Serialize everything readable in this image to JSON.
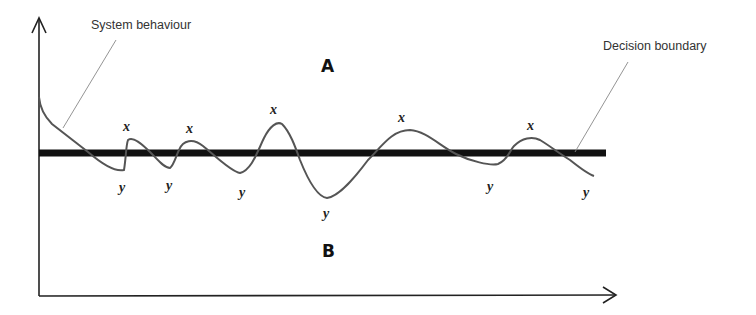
{
  "diagram": {
    "type": "decision-boundary-illustration",
    "colors": {
      "axis": "#222222",
      "boundary": "#111111",
      "curve": "#555555",
      "leader": "#888888",
      "text": "#333333"
    },
    "callouts": {
      "system_behaviour": "System behaviour",
      "decision_boundary": "Decision boundary"
    },
    "regions": {
      "above": "A",
      "below": "B"
    },
    "peak_labels": [
      "x",
      "x",
      "x",
      "x",
      "x"
    ],
    "trough_labels": [
      "y",
      "y",
      "y",
      "y",
      "y",
      "y"
    ]
  }
}
